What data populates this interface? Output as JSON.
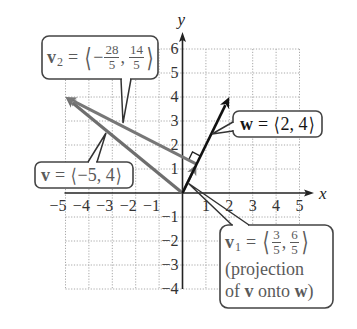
{
  "figure": {
    "axes": {
      "x_label": "x",
      "y_label": "y",
      "xlim": [
        -5,
        5
      ],
      "ylim": [
        -4,
        6
      ],
      "x_ticks": [
        -5,
        -4,
        -3,
        -2,
        -1,
        1,
        2,
        3,
        4,
        5
      ],
      "y_ticks": [
        -4,
        -3,
        -2,
        -1,
        1,
        2,
        3,
        4,
        5,
        6
      ],
      "grid": "dotted",
      "minus_sign": "−"
    },
    "vectors": [
      {
        "name": "v",
        "from": [
          0,
          0
        ],
        "to": [
          -5,
          4
        ],
        "color": "#6e6e6e",
        "width": 3.2
      },
      {
        "name": "v2",
        "from": [
          0.6,
          1.2
        ],
        "to": [
          -5,
          4
        ],
        "color": "#777777",
        "width": 3.0
      },
      {
        "name": "v1",
        "from": [
          0,
          0
        ],
        "to": [
          0.6,
          1.2
        ],
        "color": "#7a7a7a",
        "width": 2.6
      },
      {
        "name": "w",
        "from": [
          0,
          0
        ],
        "to": [
          2,
          4
        ],
        "color": "#111111",
        "width": 2.6
      }
    ],
    "right_angle_at": [
      0.6,
      1.2
    ],
    "colors": {
      "grid": "#a8a8a8",
      "axis": "#222222",
      "callout_border": "#444444"
    }
  },
  "callouts": {
    "v2": {
      "symbol": "v",
      "subscript": "2",
      "equals": "=",
      "open": "⟨",
      "minus": "−",
      "frac1": {
        "num": "28",
        "den": "5"
      },
      "comma": ",",
      "frac2": {
        "num": "14",
        "den": "5"
      },
      "close": "⟩"
    },
    "w": {
      "symbol": "w",
      "equals": "=",
      "open": "⟨",
      "value": " 2, 4",
      "close": "⟩"
    },
    "v": {
      "symbol": "v",
      "equals": "=",
      "open": "⟨",
      "value": "−5, 4",
      "close": "⟩"
    },
    "v1": {
      "symbol": "v",
      "subscript": "1",
      "equals": "=",
      "open": "⟨",
      "frac1": {
        "num": "3",
        "den": "5"
      },
      "comma": ",",
      "frac2": {
        "num": "6",
        "den": "5"
      },
      "close": "⟩",
      "line2": "(projection",
      "line3_pre": "of ",
      "line3_v": "v",
      "line3_mid": " onto ",
      "line3_w": "w",
      "line3_post": ")"
    }
  }
}
